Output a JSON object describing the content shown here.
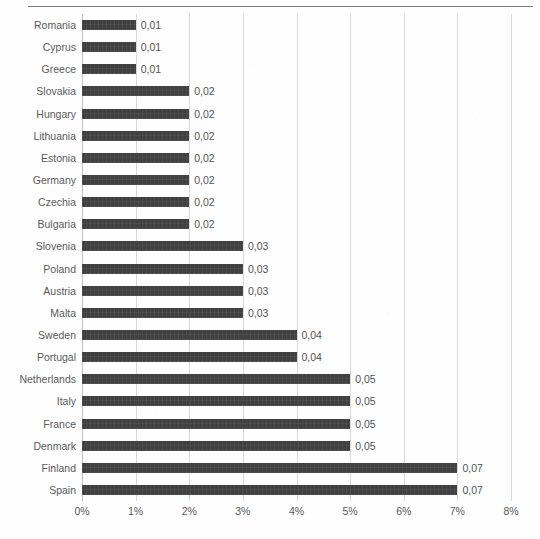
{
  "document": {
    "header_rule": true
  },
  "chart_data": {
    "type": "bar",
    "orientation": "horizontal",
    "title": "",
    "subtitle": "",
    "xlabel": "",
    "ylabel": "",
    "xlim": [
      0,
      0.08
    ],
    "grid": true,
    "legend": null,
    "bar_color": "#404040",
    "gridline_color": "#d9d9d9",
    "label_color": "#595959",
    "value_format": "comma-decimal-2",
    "axis_tick_labels": [
      "0%",
      "1%",
      "2%",
      "3%",
      "4%",
      "5%",
      "6%",
      "7%",
      "8%"
    ],
    "axis_tick_values": [
      0,
      0.01,
      0.02,
      0.03,
      0.04,
      0.05,
      0.06,
      0.07,
      0.08
    ],
    "categories": [
      "Romania",
      "Cyprus",
      "Greece",
      "Slovakia",
      "Hungary",
      "Lithuania",
      "Estonia",
      "Germany",
      "Czechia",
      "Bulgaria",
      "Slovenia",
      "Poland",
      "Austria",
      "Malta",
      "Sweden",
      "Portugal",
      "Netherlands",
      "Italy",
      "France",
      "Denmark",
      "Finland",
      "Spain"
    ],
    "values": [
      0.01,
      0.01,
      0.01,
      0.02,
      0.02,
      0.02,
      0.02,
      0.02,
      0.02,
      0.02,
      0.03,
      0.03,
      0.03,
      0.03,
      0.04,
      0.04,
      0.05,
      0.05,
      0.05,
      0.05,
      0.07,
      0.07
    ],
    "data_labels": [
      "0,01",
      "0,01",
      "0,01",
      "0,02",
      "0,02",
      "0,02",
      "0,02",
      "0,02",
      "0,02",
      "0,02",
      "0,03",
      "0,03",
      "0,03",
      "0,03",
      "0,04",
      "0,04",
      "0,05",
      "0,05",
      "0,05",
      "0,05",
      "0,07",
      "0,07"
    ]
  }
}
